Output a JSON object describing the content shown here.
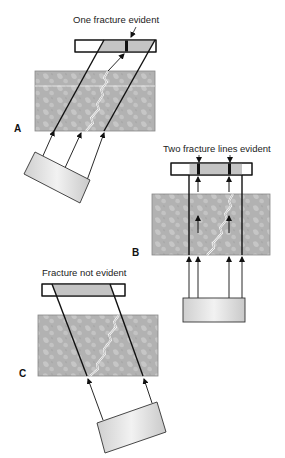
{
  "panels": {
    "A": {
      "letter": "A",
      "caption": "One fracture evident"
    },
    "B": {
      "letter": "B",
      "caption": "Two fracture lines evident"
    },
    "C": {
      "letter": "C",
      "caption": "Fracture not evident"
    }
  },
  "colors": {
    "block": "#b4b4b4",
    "block_mottle": "#c8c8c8",
    "film_shade": "#c4c4c4",
    "line": "#111111"
  }
}
